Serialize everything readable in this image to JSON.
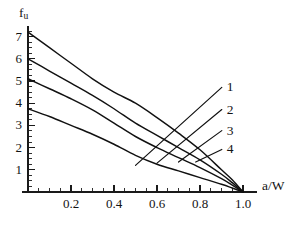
{
  "chart_data": {
    "type": "line",
    "title": "",
    "subtitle": "",
    "xlabel": "a/W",
    "ylabel": "f_u",
    "ylabel_base": "f",
    "ylabel_sub": "u",
    "xlim": [
      0.0,
      1.12
    ],
    "ylim": [
      0.0,
      7.6
    ],
    "grid": false,
    "legend_position": "inline-right-annotations",
    "x_ticks": [
      0.2,
      0.4,
      0.6,
      0.8,
      1.0
    ],
    "x_tick_labels": [
      "0.2",
      "0.4",
      "0.6",
      "0.8",
      "1.0"
    ],
    "x_minor_step": 0.05,
    "y_ticks": [
      1,
      2,
      3,
      4,
      5,
      6,
      7
    ],
    "y_tick_labels": [
      "1",
      "2",
      "3",
      "4",
      "5",
      "6",
      "7"
    ],
    "y_minor_step": 0.25,
    "x": [
      0.0,
      0.1,
      0.2,
      0.3,
      0.4,
      0.5,
      0.6,
      0.7,
      0.8,
      0.9,
      0.95,
      1.0
    ],
    "series": [
      {
        "name": "1",
        "label": "1",
        "values": [
          7.2,
          6.5,
          5.8,
          5.1,
          4.5,
          4.0,
          3.35,
          2.65,
          1.9,
          1.0,
          0.55,
          0.0
        ]
      },
      {
        "name": "2",
        "label": "2",
        "values": [
          6.0,
          5.45,
          4.9,
          4.35,
          3.75,
          3.1,
          2.55,
          2.0,
          1.45,
          0.8,
          0.42,
          0.0
        ]
      },
      {
        "name": "3",
        "label": "3",
        "values": [
          5.1,
          4.65,
          4.2,
          3.7,
          3.1,
          2.5,
          2.0,
          1.55,
          1.1,
          0.6,
          0.31,
          0.0
        ]
      },
      {
        "name": "4",
        "label": "4",
        "values": [
          3.75,
          3.4,
          3.0,
          2.6,
          2.15,
          1.65,
          1.25,
          0.95,
          0.65,
          0.35,
          0.18,
          0.0
        ]
      }
    ],
    "annotations": [
      {
        "text": "1",
        "leader_from_x": 0.5,
        "leader_from_y": 1.2,
        "label_x": 0.92,
        "label_y": 4.85
      },
      {
        "text": "2",
        "leader_from_x": 0.6,
        "leader_from_y": 1.3,
        "label_x": 0.92,
        "label_y": 3.85
      },
      {
        "text": "3",
        "leader_from_x": 0.7,
        "leader_from_y": 1.35,
        "label_x": 0.92,
        "label_y": 2.9
      },
      {
        "text": "4",
        "leader_from_x": 0.78,
        "leader_from_y": 1.35,
        "label_x": 0.92,
        "label_y": 2.05
      }
    ]
  },
  "axes": {
    "y_title_base": "f",
    "y_title_sub": "u",
    "x_title": "a/W"
  },
  "colors": {
    "curve": "#111111",
    "axis": "#1a1a1a",
    "text": "#131313",
    "background": "#ffffff"
  }
}
